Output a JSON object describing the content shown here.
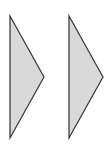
{
  "shapes": [
    {
      "name": "left-triangle",
      "points": "10,16 44,77 10,138",
      "fill": "#d9d9d9",
      "stroke": "#333333"
    },
    {
      "name": "right-triangle",
      "points": "69,16 103,77 69,138",
      "fill": "#d9d9d9",
      "stroke": "#333333"
    }
  ]
}
